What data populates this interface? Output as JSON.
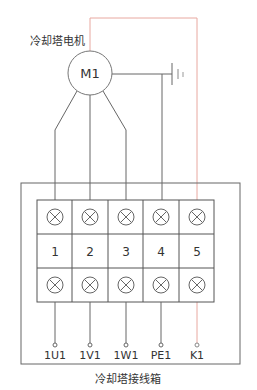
{
  "motor": {
    "title": "冷却塔电机",
    "label": "M1"
  },
  "junction_box": {
    "caption": "冷却塔接线箱",
    "terminal_numbers": [
      "1",
      "2",
      "3",
      "4",
      "5"
    ],
    "output_labels": [
      "1U1",
      "1V1",
      "1W1",
      "PE1",
      "K1"
    ]
  },
  "colors": {
    "line": "#666666",
    "control_line": "#e8a8a0",
    "background": "#ffffff"
  },
  "icons": {
    "terminal": "circle-x-terminal-icon",
    "ground": "ground-icon",
    "endpoint": "small-circle-endpoint-icon"
  }
}
